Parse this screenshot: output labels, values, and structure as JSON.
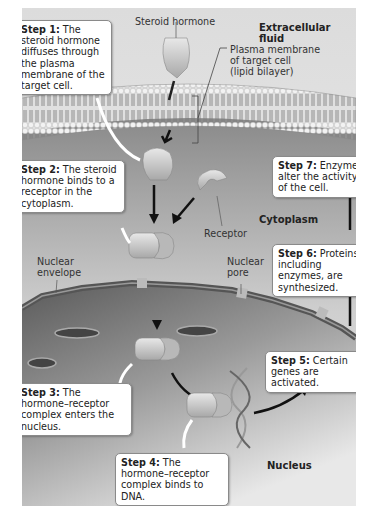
{
  "figure": {
    "regions": {
      "extracellular": "Extracellular fluid",
      "cytoplasm": "Cytoplasm",
      "nucleus": "Nucleus"
    },
    "labels": {
      "steroid_hormone": "Steroid hormone",
      "plasma_membrane_1": "Plasma membrane",
      "plasma_membrane_2": "of target cell",
      "plasma_membrane_3": "(lipid bilayer)",
      "receptor": "Receptor",
      "nuclear_envelope_1": "Nuclear",
      "nuclear_envelope_2": "envelope",
      "nuclear_pore_1": "Nuclear",
      "nuclear_pore_2": "pore"
    },
    "steps": [
      {
        "title": "Step 1:",
        "text": "The steroid hormone diffuses through the plasma membrane of the target cell."
      },
      {
        "title": "Step 2:",
        "text": "The steroid hormone binds to a receptor in the cytoplasm."
      },
      {
        "title": "Step 3:",
        "text": "The hormone–receptor complex enters the nucleus."
      },
      {
        "title": "Step 4:",
        "text": "The hormone–receptor complex binds to DNA."
      },
      {
        "title": "Step 5:",
        "text": "Certain genes are activated."
      },
      {
        "title": "Step 6:",
        "text": "Proteins, including enzymes, are synthesized."
      },
      {
        "title": "Step 7:",
        "text": "Enzymes alter the activity of the cell."
      }
    ]
  }
}
